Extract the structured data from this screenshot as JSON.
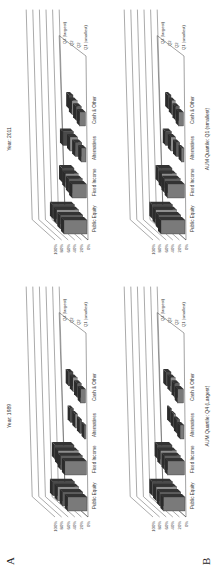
{
  "panels": [
    {
      "label": "A",
      "charts": [
        {
          "title": "Year: 1989"
        },
        {
          "title": "Year: 2011"
        }
      ]
    },
    {
      "label": "B",
      "charts": [
        {
          "title": "AUM Quartile: Q4 (Largest)"
        },
        {
          "title": "AUM Quartile: Q1 (smallest)"
        }
      ]
    }
  ],
  "chart_data": [
    {
      "type": "bar",
      "title": "Year: 1989",
      "categories": [
        "Public Equity",
        "Fixed Income",
        "Alternatives",
        "Cash & Other"
      ],
      "series": [
        {
          "name": "Q1 (smallest)",
          "values": [
            40,
            45,
            3,
            10
          ]
        },
        {
          "name": "Q2",
          "values": [
            42,
            45,
            4,
            9
          ]
        },
        {
          "name": "Q2",
          "values": [
            44,
            42,
            5,
            9
          ]
        },
        {
          "name": "Q4 (largest)",
          "values": [
            45,
            40,
            6,
            9
          ]
        }
      ],
      "ylabel": "",
      "xlabel": "",
      "yticks": [
        "0%",
        "20%",
        "40%",
        "60%",
        "80%",
        "100%"
      ],
      "ylim": [
        0,
        100
      ],
      "style": "3d"
    },
    {
      "type": "bar",
      "title": "Year: 2011",
      "categories": [
        "Public Equity",
        "Fixed Income",
        "Alternatives",
        "Cash & Other"
      ],
      "series": [
        {
          "name": "Q1 (smallest)",
          "values": [
            48,
            30,
            10,
            12
          ]
        },
        {
          "name": "Q2",
          "values": [
            47,
            28,
            14,
            11
          ]
        },
        {
          "name": "Q2",
          "values": [
            46,
            27,
            16,
            11
          ]
        },
        {
          "name": "Q4 (largest)",
          "values": [
            45,
            25,
            22,
            8
          ]
        }
      ],
      "yticks": [
        "0%",
        "20%",
        "40%",
        "60%",
        "80%",
        "100%"
      ],
      "ylim": [
        0,
        100
      ],
      "style": "3d"
    },
    {
      "type": "bar",
      "title": "AUM Quartile: Q4 (Largest)",
      "categories": [
        "Public Equity",
        "Fixed Income",
        "Alternatives",
        "Cash & Other"
      ],
      "series": [
        {
          "name": "Q1 (smallest)",
          "values": [
            45,
            35,
            8,
            12
          ]
        },
        {
          "name": "Q2",
          "values": [
            44,
            33,
            6,
            10
          ]
        },
        {
          "name": "Q2",
          "values": [
            43,
            33,
            4,
            10
          ]
        },
        {
          "name": "Q4 (largest)",
          "values": [
            42,
            30,
            3,
            10
          ]
        }
      ],
      "yticks": [
        "0%",
        "20%",
        "40%",
        "60%",
        "80%",
        "100%"
      ],
      "ylim": [
        0,
        100
      ],
      "style": "3d"
    },
    {
      "type": "bar",
      "title": "AUM Quartile: Q1 (smallest)",
      "categories": [
        "Public Equity",
        "Fixed Income",
        "Alternatives",
        "Cash & Other"
      ],
      "series": [
        {
          "name": "Q1 (smallest)",
          "values": [
            50,
            35,
            5,
            10
          ]
        },
        {
          "name": "Q2",
          "values": [
            46,
            33,
            8,
            8
          ]
        },
        {
          "name": "Q2",
          "values": [
            44,
            30,
            10,
            7
          ]
        },
        {
          "name": "Q4 (largest)",
          "values": [
            42,
            28,
            12,
            6
          ]
        }
      ],
      "yticks": [
        "0%",
        "20%",
        "40%",
        "60%",
        "80%",
        "100%"
      ],
      "ylim": [
        0,
        100
      ],
      "style": "3d"
    }
  ]
}
